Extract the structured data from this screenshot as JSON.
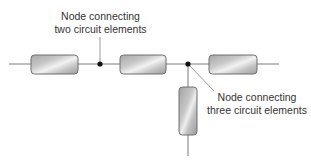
{
  "diagram": {
    "colors": {
      "wire": "#7a7a7a",
      "node": "#111111",
      "resistor_border": "#6e6e6e",
      "resistor_dark": "#a8a8a8",
      "resistor_light": "#f2f2f2",
      "leader_line": "#9a9a9a",
      "text": "#333333"
    },
    "elements": [
      {
        "id": "resistor-1",
        "orientation": "horizontal",
        "x": 31,
        "y": 55,
        "w": 47,
        "h": 19
      },
      {
        "id": "resistor-2",
        "orientation": "horizontal",
        "x": 120,
        "y": 55,
        "w": 46,
        "h": 19
      },
      {
        "id": "resistor-3",
        "orientation": "horizontal",
        "x": 209,
        "y": 55,
        "w": 48,
        "h": 19
      },
      {
        "id": "resistor-4",
        "orientation": "vertical",
        "x": 179,
        "y": 87,
        "w": 18,
        "h": 48
      }
    ],
    "nodes": [
      {
        "id": "node-two",
        "x": 100,
        "y": 64
      },
      {
        "id": "node-three",
        "x": 188,
        "y": 64
      }
    ],
    "labels": {
      "node_two": {
        "line1": "Node connecting",
        "line2": "two circuit elements"
      },
      "node_three": {
        "line1": "Node connecting",
        "line2": "three circuit elements"
      }
    }
  }
}
